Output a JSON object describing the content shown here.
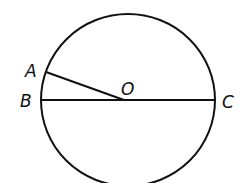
{
  "diagram": {
    "type": "geometry-circle",
    "points": {
      "A": {
        "label": "A"
      },
      "B": {
        "label": "B"
      },
      "C": {
        "label": "C"
      },
      "O": {
        "label": "O"
      }
    },
    "segments": [
      "OA",
      "BC"
    ]
  }
}
